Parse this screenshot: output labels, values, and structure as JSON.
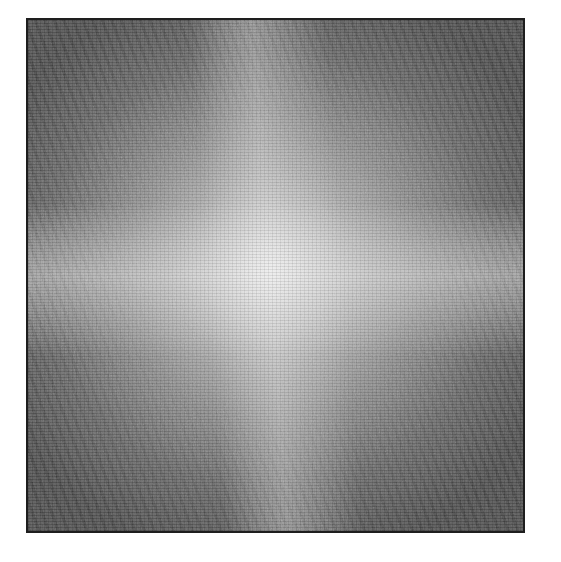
{
  "image": {
    "type": "fourier-magnitude-spectrum",
    "description": "Grayscale 2D frequency spectrum with bright DC center, horizontal and slightly tilted vertical bright bands, dark corners with diagonal streaks",
    "colors": {
      "background": "#ffffff",
      "frame_border": "#1e1e1e",
      "center": "#eaeaea",
      "mid": "#a6a6a6",
      "corner": "#4a4a4a"
    },
    "frame": {
      "x": 26,
      "y": 18,
      "width": 499,
      "height": 515
    },
    "features": {
      "center_point": [
        275,
        265
      ],
      "horizontal_band_y": 265,
      "vertical_band_tilt_deg": -4
    }
  }
}
